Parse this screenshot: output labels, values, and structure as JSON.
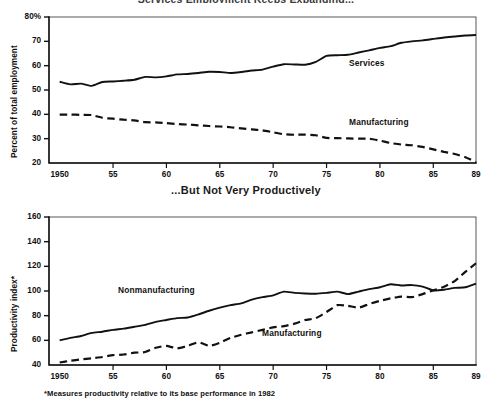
{
  "figure": {
    "clipped_top_title": "Services Employment Keeps Expanding...",
    "middle_title": "...But Not Very Productively",
    "footnote": "*Measures productivity relative to its base performance in 1982",
    "line_color": "#111111",
    "background": "#ffffff"
  },
  "chart_data": [
    {
      "type": "line",
      "id": "employment-share",
      "title": "Services Employment Keeps Expanding...",
      "xlabel": "",
      "ylabel": "Percent of total employment",
      "xlim": [
        1949,
        1989
      ],
      "ylim": [
        20,
        80
      ],
      "grid": false,
      "legend_position": "inline-annotation",
      "xticks": [
        1950,
        1955,
        1960,
        1965,
        1970,
        1975,
        1980,
        1985,
        1989
      ],
      "xticklabels": [
        "1950",
        "55",
        "60",
        "65",
        "70",
        "75",
        "80",
        "85",
        "89"
      ],
      "yticks": [
        20,
        30,
        40,
        50,
        60,
        70,
        80
      ],
      "yticklabels": [
        "20",
        "30",
        "40",
        "50",
        "60",
        "70",
        "80%"
      ],
      "x": [
        1950,
        1951,
        1952,
        1953,
        1954,
        1955,
        1956,
        1957,
        1958,
        1959,
        1960,
        1961,
        1962,
        1963,
        1964,
        1965,
        1966,
        1967,
        1968,
        1969,
        1970,
        1971,
        1972,
        1973,
        1974,
        1975,
        1976,
        1977,
        1978,
        1979,
        1980,
        1981,
        1982,
        1983,
        1984,
        1985,
        1986,
        1987,
        1988,
        1989
      ],
      "series": [
        {
          "name": "Services",
          "style": "solid",
          "values": [
            53.4,
            52.3,
            52.6,
            51.7,
            53.3,
            53.5,
            53.8,
            54.2,
            55.4,
            55.2,
            55.6,
            56.4,
            56.6,
            57.0,
            57.5,
            57.4,
            57.0,
            57.4,
            58.0,
            58.4,
            59.6,
            60.6,
            60.5,
            60.4,
            61.6,
            64.0,
            64.3,
            64.5,
            65.4,
            66.3,
            67.3,
            68.0,
            69.4,
            70.0,
            70.4,
            71.0,
            71.6,
            72.0,
            72.4,
            72.6
          ]
        },
        {
          "name": "Manufacturing",
          "style": "dashed",
          "values": [
            39.9,
            39.9,
            39.8,
            39.7,
            38.6,
            38.2,
            37.8,
            37.5,
            36.8,
            36.7,
            36.4,
            36.0,
            35.8,
            35.5,
            35.2,
            35.0,
            34.7,
            34.2,
            33.8,
            33.4,
            32.6,
            31.8,
            31.6,
            31.7,
            31.4,
            30.3,
            30.2,
            30.1,
            30.0,
            30.0,
            29.2,
            28.2,
            27.6,
            27.3,
            26.6,
            25.6,
            24.6,
            23.7,
            22.4,
            20.4
          ]
        }
      ]
    },
    {
      "type": "line",
      "id": "productivity-index",
      "title": "...But Not Very Productively",
      "xlabel": "",
      "ylabel": "Productivity index*",
      "xlim": [
        1949,
        1989
      ],
      "ylim": [
        40,
        160
      ],
      "grid": false,
      "legend_position": "inline-annotation",
      "xticks": [
        1950,
        1955,
        1960,
        1965,
        1970,
        1975,
        1980,
        1985,
        1989
      ],
      "xticklabels": [
        "1950",
        "55",
        "60",
        "65",
        "70",
        "75",
        "80",
        "85",
        "89"
      ],
      "yticks": [
        40,
        60,
        80,
        100,
        120,
        140,
        160
      ],
      "yticklabels": [
        "40",
        "60",
        "80",
        "100",
        "120",
        "140",
        "160"
      ],
      "x": [
        1950,
        1951,
        1952,
        1953,
        1954,
        1955,
        1956,
        1957,
        1958,
        1959,
        1960,
        1961,
        1962,
        1963,
        1964,
        1965,
        1966,
        1967,
        1968,
        1969,
        1970,
        1971,
        1972,
        1973,
        1974,
        1975,
        1976,
        1977,
        1978,
        1979,
        1980,
        1981,
        1982,
        1983,
        1984,
        1985,
        1986,
        1987,
        1988,
        1989
      ],
      "series": [
        {
          "name": "Nonmanufacturing",
          "style": "solid",
          "values": [
            60.0,
            62.0,
            63.5,
            66.0,
            67.0,
            68.5,
            69.5,
            71.0,
            72.5,
            75.0,
            76.5,
            78.0,
            78.5,
            81.0,
            84.0,
            86.5,
            88.5,
            90.0,
            93.0,
            95.0,
            96.5,
            99.5,
            98.5,
            98.0,
            97.8,
            98.5,
            99.5,
            97.5,
            99.5,
            101.5,
            103.0,
            105.5,
            104.5,
            104.8,
            103.5,
            100.5,
            101.0,
            102.5,
            103.0,
            106.0,
            102.0
          ]
        },
        {
          "name": "Manufacturing",
          "style": "dashed",
          "values": [
            42.0,
            43.5,
            44.5,
            45.5,
            46.5,
            48.0,
            48.5,
            50.0,
            50.5,
            54.0,
            55.5,
            53.5,
            55.5,
            58.5,
            55.5,
            58.0,
            62.0,
            64.5,
            66.5,
            68.5,
            70.5,
            71.5,
            73.5,
            76.5,
            78.0,
            83.0,
            88.5,
            88.0,
            86.5,
            89.5,
            92.0,
            94.0,
            95.5,
            95.0,
            97.5,
            100.5,
            103.5,
            108.0,
            115.5,
            122.5,
            131.0
          ]
        }
      ]
    }
  ],
  "panels": {
    "top": {
      "ylabel": "Percent of total employment",
      "yticklabels": [
        "80%",
        "70",
        "60",
        "50",
        "40",
        "30",
        "20"
      ],
      "xticklabels": [
        "1950",
        "55",
        "60",
        "65",
        "70",
        "75",
        "80",
        "85",
        "89"
      ],
      "annotations": [
        {
          "name": "Services",
          "text": "Services"
        },
        {
          "name": "Manufacturing",
          "text": "Manufacturing"
        }
      ]
    },
    "bottom": {
      "ylabel": "Productivity index*",
      "yticklabels": [
        "160",
        "140",
        "120",
        "100",
        "80",
        "60",
        "40"
      ],
      "xticklabels": [
        "1950",
        "55",
        "60",
        "65",
        "70",
        "75",
        "80",
        "85",
        "89"
      ],
      "annotations": [
        {
          "name": "Nonmanufacturing",
          "text": "Nonmanufacturing"
        },
        {
          "name": "Manufacturing",
          "text": "Manufacturing"
        }
      ]
    }
  }
}
